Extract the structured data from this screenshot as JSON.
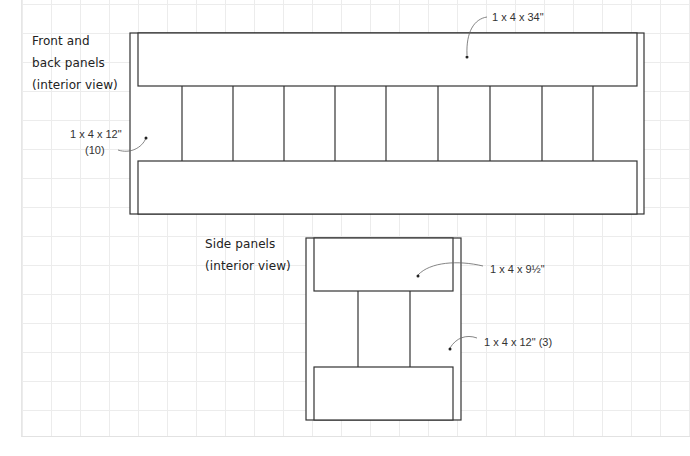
{
  "front_panel": {
    "title_lines": [
      "Front and",
      "back panels",
      "(interior view)"
    ],
    "labels": {
      "rail": "1 x 4 x 34\"",
      "slat_line1": "1 x 4 x 12\"",
      "slat_line2": "(10)"
    },
    "slat_line_positions_x": [
      182,
      233,
      284,
      335,
      386,
      438,
      490,
      542,
      593
    ]
  },
  "side_panel": {
    "title_lines": [
      "Side panels",
      "(interior view)"
    ],
    "labels": {
      "rail": "1 x 4 x 9½\"",
      "slat": "1 x 4 x 12\" (3)"
    },
    "slat_line_positions_x": [
      358,
      410
    ]
  },
  "colors": {
    "line": "#333333",
    "grid": "#ececec",
    "text": "#222222"
  }
}
